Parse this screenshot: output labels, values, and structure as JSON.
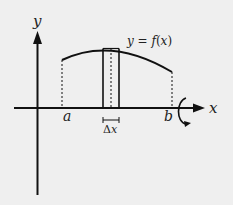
{
  "diagram": {
    "axes": {
      "x_label": "x",
      "y_label": "y"
    },
    "curve": {
      "label": "y = f(x)",
      "label_parts": {
        "lhs": "y",
        "eq": " = ",
        "f": "f",
        "open": "(",
        "var": "x",
        "close": ")"
      }
    },
    "bounds": {
      "a_label": "a",
      "b_label": "b"
    },
    "strip": {
      "width_label": "Δx",
      "width_label_parts": {
        "delta": "Δ",
        "var": "x"
      }
    },
    "rotation": {
      "about": "x-axis",
      "icon": "rotation-arrow-icon"
    },
    "colors": {
      "background": "#efefef",
      "ink": "#111111"
    }
  }
}
